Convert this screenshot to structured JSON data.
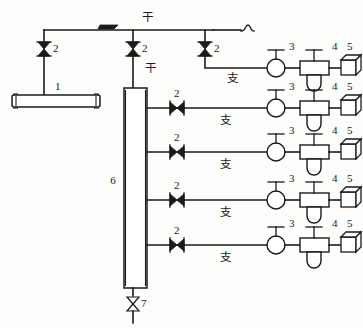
{
  "diagram": {
    "background_color": "#fdfdfc",
    "line_color": "#1a1a1a",
    "labels": {
      "trunk_top": "干",
      "trunk_mid": "干",
      "branch": "支",
      "item1": "1",
      "item2": "2",
      "item3": "3",
      "item4": "4",
      "item5": "5",
      "item6": "6",
      "item7": "7"
    },
    "components": {
      "horizontal_tank": {
        "tag": "1",
        "name": "horizontal-cylindrical-tank"
      },
      "valve": {
        "tag": "2",
        "name": "bowtie-valve"
      },
      "meter": {
        "tag": "3",
        "name": "circular-gas-meter"
      },
      "regulator": {
        "tag": "4",
        "name": "regulator-with-bowl"
      },
      "appliance": {
        "tag": "5",
        "name": "cube-appliance"
      },
      "vertical_column": {
        "tag": "6",
        "name": "vertical-riser-column"
      },
      "drain_valve": {
        "tag": "7",
        "name": "bottom-drain-valve"
      }
    },
    "trunk_valves": [
      {
        "tag": "2",
        "x": 44,
        "y": 48
      },
      {
        "tag": "2",
        "x": 133,
        "y": 48
      },
      {
        "tag": "2",
        "x": 205,
        "y": 48
      }
    ],
    "branches": [
      {
        "index": 0,
        "y": 68,
        "valve_tag": "2",
        "meter_tag": "3",
        "regulator_tag": "4",
        "appliance_tag": "5",
        "label": "支"
      },
      {
        "index": 1,
        "y": 108,
        "valve_tag": "2",
        "meter_tag": "3",
        "regulator_tag": "4",
        "appliance_tag": "5",
        "label": "支"
      },
      {
        "index": 2,
        "y": 152,
        "valve_tag": "2",
        "meter_tag": "3",
        "regulator_tag": "4",
        "appliance_tag": "5",
        "label": "支"
      },
      {
        "index": 3,
        "y": 200,
        "valve_tag": "2",
        "meter_tag": "3",
        "regulator_tag": "4",
        "appliance_tag": "5",
        "label": "支"
      },
      {
        "index": 4,
        "y": 245,
        "valve_tag": "2",
        "meter_tag": "3",
        "regulator_tag": "4",
        "appliance_tag": "5",
        "label": "支"
      }
    ]
  }
}
